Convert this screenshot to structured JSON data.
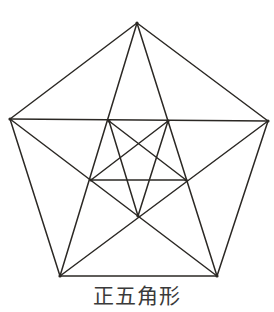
{
  "caption": "正五角形",
  "colors": {
    "line": "#2b2824",
    "text": "#3a3a3a",
    "background": "#ffffff"
  },
  "diagram": {
    "title": "正五角形",
    "vertices": {
      "A": [
        137,
        23
      ],
      "B": [
        268,
        121
      ],
      "C": [
        217,
        276
      ],
      "D": [
        60,
        276
      ],
      "E": [
        10,
        119
      ]
    },
    "inner_points": {
      "P1": [
        109,
        121
      ],
      "P2": [
        168,
        121
      ],
      "P3": [
        186,
        180
      ],
      "P4": [
        138,
        216
      ],
      "P5": [
        91,
        180
      ]
    },
    "edges": [
      [
        "A",
        "B"
      ],
      [
        "B",
        "C"
      ],
      [
        "C",
        "D"
      ],
      [
        "D",
        "E"
      ],
      [
        "E",
        "A"
      ],
      [
        "A",
        "C"
      ],
      [
        "A",
        "D"
      ],
      [
        "B",
        "D"
      ],
      [
        "B",
        "E"
      ],
      [
        "C",
        "E"
      ],
      [
        "P1",
        "P3"
      ],
      [
        "P1",
        "P4"
      ],
      [
        "P2",
        "P5"
      ],
      [
        "P2",
        "P4"
      ],
      [
        "P5",
        "P3"
      ]
    ]
  }
}
